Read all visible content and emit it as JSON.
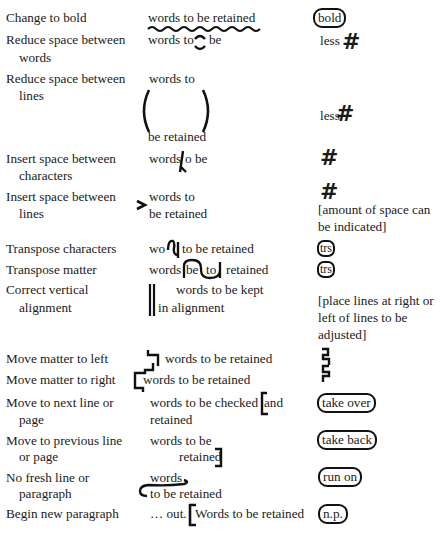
{
  "table": {
    "rows": [
      {
        "name": "Change to bold",
        "example": [
          "words to be retained"
        ],
        "margin_mark": "bold"
      },
      {
        "name": [
          "Reduce space between",
          "words"
        ],
        "example": [
          "words to",
          "be"
        ],
        "margin_mark": "less",
        "margin_symbol": "#"
      },
      {
        "name": [
          "Reduce space between",
          "lines"
        ],
        "example": [
          "words to",
          "be retained"
        ],
        "margin_mark": "less",
        "margin_symbol": "#"
      },
      {
        "name": [
          "Insert space between",
          "characters"
        ],
        "example": [
          "words",
          "o be"
        ],
        "margin_symbol": "#"
      },
      {
        "name": [
          "Insert space between",
          "lines"
        ],
        "example": [
          "words to",
          "be retained"
        ],
        "margin_symbol": "#",
        "margin_note": [
          "[amount of space can",
          "be indicated]"
        ]
      },
      {
        "name": "Transpose characters",
        "example": [
          "wo",
          "to be retained"
        ],
        "margin_mark": "trs"
      },
      {
        "name": "Transpose matter",
        "example": [
          "words",
          "be",
          "to",
          "retained"
        ],
        "margin_mark": "trs"
      },
      {
        "name": [
          "Correct vertical",
          "alignment"
        ],
        "example": [
          "words to be kept",
          "in alignment"
        ],
        "margin_note": [
          "[place lines at right or",
          "left of lines to be",
          "adjusted]"
        ]
      },
      {
        "name": "Move matter to left",
        "example": [
          "words to be retained"
        ]
      },
      {
        "name": "Move matter to right",
        "example": [
          "words to be retained"
        ]
      },
      {
        "name": [
          "Move to next line or",
          "page"
        ],
        "example": [
          "words to be checked",
          "and",
          "retained"
        ],
        "margin_mark": "take over"
      },
      {
        "name": [
          "Move to previous line",
          "or page"
        ],
        "example": [
          "words to be",
          "retained"
        ],
        "margin_mark": "take back"
      },
      {
        "name": [
          "No fresh line or",
          "paragraph"
        ],
        "example": [
          "words",
          "to be retained"
        ],
        "margin_mark": "run on"
      },
      {
        "name": "Begin new paragraph",
        "example": [
          "… out.",
          "Words to be retained"
        ],
        "margin_mark": "n.p."
      }
    ]
  },
  "icons": {
    "wavy_underline": "wavy-underline-mark",
    "close_up": "close-up-mark",
    "parens": "close-lines-parens",
    "caret": "insert-caret-mark",
    "chevron": "insert-line-space-mark",
    "transpose": "transpose-mark",
    "double_bar": "vertical-align-bars",
    "move_left": "move-left-bracket",
    "move_right": "move-right-bracket",
    "bracket": "square-bracket-mark",
    "run_on": "run-on-line"
  }
}
